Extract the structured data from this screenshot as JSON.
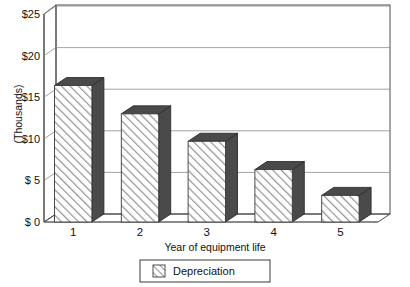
{
  "chart_data": {
    "type": "bar",
    "title": "",
    "subtitle": "",
    "categories": [
      "1",
      "2",
      "3",
      "4",
      "5"
    ],
    "values": [
      16.4,
      13.0,
      9.7,
      6.3,
      3.2
    ],
    "series": [
      {
        "name": "Depreciation",
        "values": [
          16.4,
          13.0,
          9.7,
          6.3,
          3.2
        ]
      }
    ],
    "xlabel": "Year of equipment life",
    "ylabel": "(Thousands)",
    "ylim": [
      0,
      25
    ],
    "ytick_values": [
      0,
      5,
      10,
      15,
      20,
      25
    ],
    "ytick_labels": [
      "$ 0",
      "$ 5",
      "$10",
      "$15",
      "$20",
      "$25"
    ],
    "xtick_labels": [
      "1",
      "2",
      "3",
      "4",
      "5"
    ],
    "grid": true,
    "grid_axis": "y",
    "legend": {
      "position": "bottom",
      "entries": [
        {
          "label": "Depreciation",
          "pattern": "diagonal-hatch"
        }
      ]
    },
    "style": {
      "three_d": true,
      "bar_face_pattern": "diagonal-hatch",
      "bar_face_color": "#ffffff",
      "hatch_color": "#8a8a8a",
      "bar_shade_color": "#4a4a4a",
      "axis_color": "#4d4d4d",
      "grid_color": "#8c8c8c",
      "text_color": "#111111",
      "background": "#ffffff"
    }
  }
}
